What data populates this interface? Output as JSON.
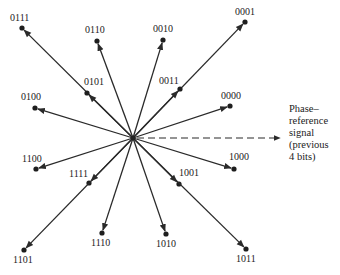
{
  "diagram": {
    "type": "phase-constellation",
    "center": [
      133,
      138
    ],
    "vectors": [
      {
        "code": "0111",
        "end": [
          22,
          28
        ],
        "label": [
          10,
          21
        ]
      },
      {
        "code": "0110",
        "end": [
          97,
          41
        ],
        "label": [
          85,
          33
        ]
      },
      {
        "code": "0010",
        "end": [
          163,
          40
        ],
        "label": [
          153,
          32
        ]
      },
      {
        "code": "0001",
        "end": [
          245,
          22
        ],
        "label": [
          235,
          15
        ]
      },
      {
        "code": "0101",
        "end": [
          87,
          93
        ],
        "label": [
          84,
          85
        ]
      },
      {
        "code": "0011",
        "end": [
          180,
          89
        ],
        "label": [
          159,
          84
        ]
      },
      {
        "code": "0100",
        "end": [
          35,
          108
        ],
        "label": [
          21,
          100
        ]
      },
      {
        "code": "0000",
        "end": [
          230,
          106
        ],
        "label": [
          221,
          99
        ]
      },
      {
        "code": "1100",
        "end": [
          36,
          169
        ],
        "label": [
          22,
          162
        ]
      },
      {
        "code": "1000",
        "end": [
          234,
          169
        ],
        "label": [
          229,
          160
        ]
      },
      {
        "code": "1111",
        "end": [
          89,
          183
        ],
        "label": [
          69,
          177
        ]
      },
      {
        "code": "1001",
        "end": [
          179,
          184
        ],
        "label": [
          179,
          176
        ]
      },
      {
        "code": "1110",
        "end": [
          102,
          233
        ],
        "label": [
          91,
          246
        ]
      },
      {
        "code": "1010",
        "end": [
          166,
          234
        ],
        "label": [
          156,
          247
        ]
      },
      {
        "code": "1101",
        "end": [
          24,
          250
        ],
        "label": [
          13,
          263
        ]
      },
      {
        "code": "1011",
        "end": [
          246,
          249
        ],
        "label": [
          236,
          262
        ]
      }
    ],
    "reference": {
      "end": [
        280,
        138
      ],
      "text": "Phase–\nreference\nsignal\n(previous\n4 bits)"
    },
    "colors": {
      "line": "#2a2a2a",
      "text": "#222222",
      "background": "#ffffff"
    }
  }
}
